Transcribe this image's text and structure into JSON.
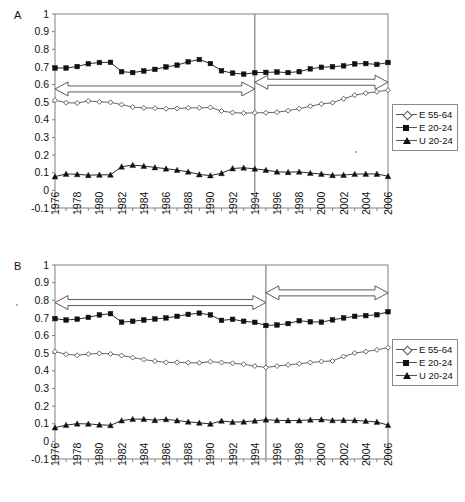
{
  "figure": {
    "background": "#ffffff",
    "axis_color": "#808080",
    "series_color_dark": "#111111",
    "series_color_light": "#555555"
  },
  "panels": [
    {
      "letter": "A",
      "divider_year": 1994,
      "legend": {
        "position": "right",
        "entries": [
          {
            "label": "E 55-64",
            "marker": "open-diamond"
          },
          {
            "label": "E 20-24",
            "marker": "filled-square"
          },
          {
            "label": "U 20-24",
            "marker": "filled-triangle"
          }
        ]
      },
      "annotations": [
        {
          "name": "period-1-arrow",
          "type": "double-headed-arrow",
          "x_from": 1976,
          "x_to": 1994,
          "y": 0.575
        },
        {
          "name": "period-2-arrow",
          "type": "double-headed-arrow",
          "x_from": 1994,
          "x_to": 2006,
          "y": 0.613
        }
      ]
    },
    {
      "letter": "B",
      "divider_year": 1995,
      "legend": {
        "position": "right",
        "entries": [
          {
            "label": "E 55-64",
            "marker": "open-diamond"
          },
          {
            "label": "E 20-24",
            "marker": "filled-square"
          },
          {
            "label": "U 20-24",
            "marker": "filled-triangle"
          }
        ]
      },
      "annotations": [
        {
          "name": "period-1-arrow",
          "type": "double-headed-arrow",
          "x_from": 1976,
          "x_to": 1995,
          "y": 0.787
        },
        {
          "name": "period-2-arrow",
          "type": "double-headed-arrow",
          "x_from": 1995,
          "x_to": 2006,
          "y": 0.842
        }
      ]
    }
  ],
  "chart_data": [
    {
      "type": "line",
      "title": "A",
      "xlabel": "",
      "ylabel": "",
      "xlim": [
        1976,
        2006
      ],
      "ylim": [
        -0.1,
        1
      ],
      "yticks": [
        -0.1,
        0,
        0.1,
        0.2,
        0.3,
        0.4,
        0.5,
        0.6,
        0.7,
        0.8,
        0.9,
        1
      ],
      "ytick_labels": [
        "-0.1",
        "0",
        "0.1",
        "0.2",
        "0.3",
        "0.4",
        "0.5",
        "0.6",
        "0.7",
        "0.8",
        "0.9",
        "1"
      ],
      "x": [
        1976,
        1977,
        1978,
        1979,
        1980,
        1981,
        1982,
        1983,
        1984,
        1985,
        1986,
        1987,
        1988,
        1989,
        1990,
        1991,
        1992,
        1993,
        1994,
        1995,
        1996,
        1997,
        1998,
        1999,
        2000,
        2001,
        2002,
        2003,
        2004,
        2005,
        2006
      ],
      "xtick_labels": [
        "1976",
        "",
        "1978",
        "",
        "1980",
        "",
        "1982",
        "",
        "1984",
        "",
        "1986",
        "",
        "1988",
        "",
        "1990",
        "",
        "1992",
        "",
        "1994",
        "",
        "1996",
        "",
        "1998",
        "",
        "2000",
        "",
        "2002",
        "",
        "2004",
        "",
        "2006"
      ],
      "grid": false,
      "legend_position": "right",
      "vertical_divider": 1994,
      "series": [
        {
          "name": "E 55-64",
          "marker": "open-diamond",
          "values": [
            0.511,
            0.497,
            0.495,
            0.507,
            0.502,
            0.499,
            0.486,
            0.472,
            0.468,
            0.466,
            0.463,
            0.464,
            0.468,
            0.468,
            0.47,
            0.45,
            0.441,
            0.438,
            0.44,
            0.44,
            0.443,
            0.452,
            0.463,
            0.477,
            0.49,
            0.497,
            0.519,
            0.54,
            0.551,
            0.559,
            0.568
          ]
        },
        {
          "name": "E 20-24",
          "marker": "filled-square",
          "values": [
            0.694,
            0.694,
            0.702,
            0.718,
            0.725,
            0.726,
            0.673,
            0.668,
            0.677,
            0.686,
            0.7,
            0.71,
            0.729,
            0.742,
            0.719,
            0.678,
            0.665,
            0.659,
            0.667,
            0.669,
            0.671,
            0.668,
            0.673,
            0.689,
            0.698,
            0.701,
            0.706,
            0.717,
            0.719,
            0.714,
            0.725
          ]
        },
        {
          "name": "U 20-24",
          "marker": "filled-triangle",
          "values": [
            0.078,
            0.093,
            0.091,
            0.086,
            0.088,
            0.088,
            0.134,
            0.143,
            0.138,
            0.13,
            0.123,
            0.115,
            0.105,
            0.09,
            0.084,
            0.097,
            0.124,
            0.128,
            0.122,
            0.115,
            0.105,
            0.103,
            0.105,
            0.098,
            0.093,
            0.086,
            0.087,
            0.092,
            0.093,
            0.093,
            0.08
          ]
        }
      ]
    },
    {
      "type": "line",
      "title": "B",
      "xlabel": "",
      "ylabel": "",
      "xlim": [
        1976,
        2006
      ],
      "ylim": [
        -0.1,
        1
      ],
      "yticks": [
        -0.1,
        0,
        0.1,
        0.2,
        0.3,
        0.4,
        0.5,
        0.6,
        0.7,
        0.8,
        0.9,
        1
      ],
      "ytick_labels": [
        "-0.1",
        "0",
        "0.1",
        "0.2",
        "0.3",
        "0.4",
        "0.5",
        "0.6",
        "0.7",
        "0.8",
        "0.9",
        "1"
      ],
      "x": [
        1976,
        1977,
        1978,
        1979,
        1980,
        1981,
        1982,
        1983,
        1984,
        1985,
        1986,
        1987,
        1988,
        1989,
        1990,
        1991,
        1992,
        1993,
        1994,
        1995,
        1996,
        1997,
        1998,
        1999,
        2000,
        2001,
        2002,
        2003,
        2004,
        2005,
        2006
      ],
      "xtick_labels": [
        "1976",
        "",
        "1978",
        "",
        "1980",
        "",
        "1982",
        "",
        "1984",
        "",
        "1986",
        "",
        "1988",
        "",
        "1990",
        "",
        "1992",
        "",
        "1994",
        "",
        "1996",
        "",
        "1998",
        "",
        "2000",
        "",
        "2002",
        "",
        "2004",
        "",
        "2006"
      ],
      "grid": false,
      "legend_position": "right",
      "vertical_divider": 1995,
      "series": [
        {
          "name": "E 55-64",
          "marker": "open-diamond",
          "values": [
            0.509,
            0.494,
            0.488,
            0.495,
            0.499,
            0.496,
            0.487,
            0.475,
            0.464,
            0.455,
            0.448,
            0.448,
            0.446,
            0.445,
            0.452,
            0.447,
            0.443,
            0.437,
            0.427,
            0.419,
            0.427,
            0.434,
            0.44,
            0.447,
            0.453,
            0.456,
            0.481,
            0.501,
            0.509,
            0.519,
            0.531
          ]
        },
        {
          "name": "E 20-24",
          "marker": "filled-square",
          "values": [
            0.696,
            0.688,
            0.693,
            0.703,
            0.717,
            0.724,
            0.676,
            0.681,
            0.688,
            0.694,
            0.7,
            0.709,
            0.72,
            0.727,
            0.717,
            0.686,
            0.692,
            0.681,
            0.675,
            0.657,
            0.66,
            0.668,
            0.684,
            0.678,
            0.676,
            0.689,
            0.7,
            0.709,
            0.713,
            0.718,
            0.735
          ]
        },
        {
          "name": "U 20-24",
          "marker": "filled-triangle",
          "values": [
            0.078,
            0.092,
            0.1,
            0.099,
            0.094,
            0.091,
            0.118,
            0.126,
            0.126,
            0.12,
            0.125,
            0.118,
            0.111,
            0.105,
            0.099,
            0.116,
            0.109,
            0.111,
            0.116,
            0.123,
            0.119,
            0.118,
            0.118,
            0.122,
            0.124,
            0.119,
            0.12,
            0.119,
            0.115,
            0.11,
            0.092
          ]
        }
      ]
    }
  ]
}
